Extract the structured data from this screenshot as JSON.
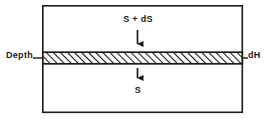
{
  "figure": {
    "type": "schematic-diagram",
    "background_color": "#ffffff",
    "line_color": "#1a1a1a",
    "labels": {
      "depth_axis": "Depth",
      "layer_thickness": "dH",
      "flux_in": "S + dS",
      "flux_out": "S"
    },
    "box": {
      "x": 42,
      "y": 5,
      "width": 201,
      "height": 108,
      "stroke_width": 1.6
    },
    "layer": {
      "name": "hatched-layer",
      "x": 42,
      "y": 52,
      "width": 201,
      "height": 12,
      "fill_pattern": "diagonal-hatch",
      "hatch_direction": "forward-slash",
      "hatch_spacing_px": 5
    },
    "arrows": [
      {
        "name": "flux-in-arrow",
        "direction": "down",
        "x": 137,
        "y_start": 30,
        "y_end": 49,
        "label": "S + dS"
      },
      {
        "name": "flux-out-arrow",
        "direction": "down",
        "x": 137,
        "y_start": 68,
        "y_end": 83,
        "label": "S"
      }
    ],
    "depth_tick": {
      "name": "depth-tick-line",
      "x1": 33,
      "x2": 42,
      "y": 58
    },
    "dh_tick": {
      "name": "dh-tick-line",
      "x1": 243,
      "x2": 247,
      "y": 58
    }
  }
}
